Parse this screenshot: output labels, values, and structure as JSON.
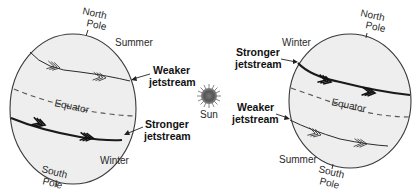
{
  "diagram": {
    "sun": {
      "label": "Sun",
      "color": "#555555"
    },
    "left_globe": {
      "north_pole": {
        "line1": "North",
        "line2": "Pole"
      },
      "south_pole": {
        "line1": "South",
        "line2": "Pole"
      },
      "north_season": "Summer",
      "south_season": "Winter",
      "equator_label": "Equator",
      "north_jet": {
        "line1": "Weaker",
        "line2": "jetstream"
      },
      "south_jet": {
        "line1": "Stronger",
        "line2": "jetstream"
      }
    },
    "right_globe": {
      "north_pole": {
        "line1": "North",
        "line2": "Pole"
      },
      "south_pole": {
        "line1": "South",
        "line2": "Pole"
      },
      "north_season": "Winter",
      "south_season": "Summer",
      "equator_label": "Equator",
      "north_jet": {
        "line1": "Stronger",
        "line2": "jetstream"
      },
      "south_jet": {
        "line1": "Weaker",
        "line2": "jetstream"
      }
    },
    "colors": {
      "globe_fill": "#eeeeee",
      "outline": "#3a3a3a",
      "text": "#2a2a2a"
    }
  }
}
